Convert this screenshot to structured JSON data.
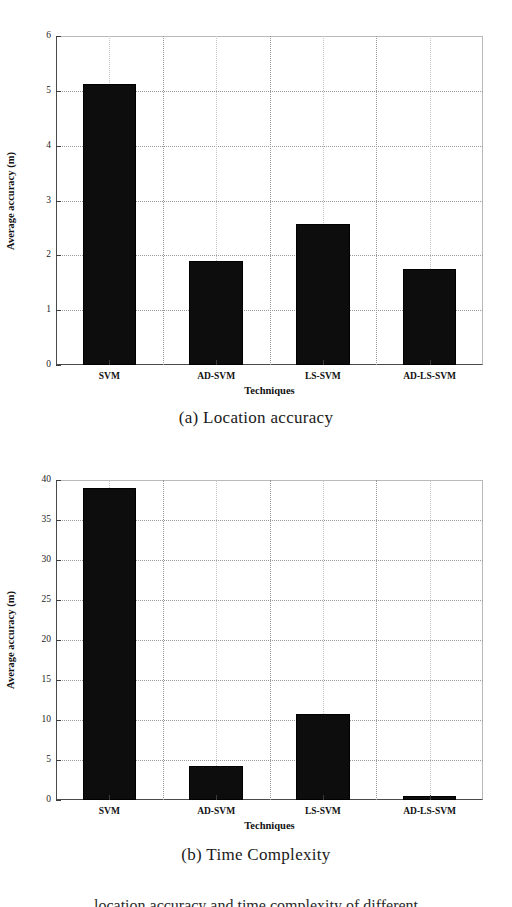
{
  "figure": {
    "background": "#ffffff",
    "bar_color": "#0d0d0d",
    "grid_color": "#9a9a9a",
    "axis_color": "#3b3b3b",
    "trailing_text": "location accuracy and time complexity of different"
  },
  "panels": [
    {
      "id": "a",
      "caption": "(a) Location accuracy"
    },
    {
      "id": "b",
      "caption": "(b) Time Complexity"
    }
  ],
  "chart_data": [
    {
      "type": "bar",
      "title": "(a) Location accuracy",
      "categories": [
        "SVM",
        "AD-SVM",
        "LS-SVM",
        "AD-LS-SVM"
      ],
      "values": [
        5.12,
        1.9,
        2.58,
        1.75
      ],
      "xlabel": "Techniques",
      "ylabel": "Average accuracy (m)",
      "ylim": [
        0,
        6
      ],
      "yticks": [
        0,
        1,
        2,
        3,
        4,
        5,
        6
      ],
      "ytick_labels": [
        "0",
        "1",
        "2",
        "3",
        "4",
        "5",
        "6"
      ],
      "grid": true,
      "legend": "none"
    },
    {
      "type": "bar",
      "title": "(b) Time Complexity",
      "categories": [
        "SVM",
        "AD-SVM",
        "LS-SVM",
        "AD-LS-SVM"
      ],
      "values": [
        39.0,
        4.2,
        10.7,
        0.5
      ],
      "xlabel": "Techniques",
      "ylabel": "Average accuracy (m)",
      "ylim": [
        0,
        40
      ],
      "yticks": [
        0,
        5,
        10,
        15,
        20,
        25,
        30,
        35,
        40
      ],
      "ytick_labels": [
        "0",
        "5",
        "10",
        "15",
        "20",
        "25",
        "30",
        "35",
        "40"
      ],
      "grid": true,
      "legend": "none"
    }
  ]
}
